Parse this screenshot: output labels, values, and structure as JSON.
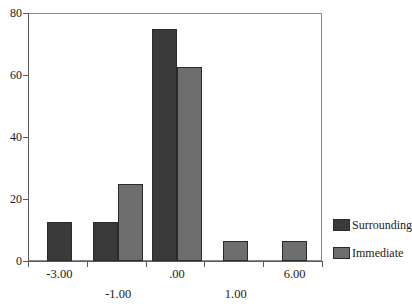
{
  "chart_data": {
    "type": "bar",
    "title": "",
    "subtitle": "",
    "xlabel": "",
    "ylabel": "",
    "grid": false,
    "legend_position": "right",
    "ylim": [
      0,
      80
    ],
    "yticks": [
      0,
      20,
      40,
      60,
      80
    ],
    "ytick_labels": [
      "0",
      "20",
      "40",
      "60",
      "80"
    ],
    "xtick_labels_upper": [
      "-3.00",
      ".00",
      "6.00"
    ],
    "xtick_labels_lower": [
      "-1.00",
      "1.00"
    ],
    "xtick_labels_all": [
      "-3.00",
      "-1.00",
      ".00",
      "1.00",
      "6.00"
    ],
    "categories": [
      "-3.00",
      "-1.00",
      ".00",
      "1.00",
      "6.00"
    ],
    "series": [
      {
        "name": "Surrounding",
        "color": "#3a3a3a",
        "values": [
          12.5,
          12.5,
          75,
          0,
          0
        ]
      },
      {
        "name": "Immediate",
        "color": "#6e6e6e",
        "values": [
          0,
          25,
          62.5,
          6.5,
          6.5
        ]
      }
    ]
  },
  "legend": {
    "items": [
      {
        "label": "Surrounding",
        "color": "#3a3a3a"
      },
      {
        "label": "Immediate",
        "color": "#6e6e6e"
      }
    ]
  },
  "axes": {
    "y": {
      "ticks": [
        {
          "label": "80",
          "value": 80
        },
        {
          "label": "60",
          "value": 60
        },
        {
          "label": "40",
          "value": 40
        },
        {
          "label": "20",
          "value": 20
        },
        {
          "label": "0",
          "value": 0
        }
      ]
    },
    "x": {
      "upper_ticks": [
        {
          "label": "-3.00"
        },
        {
          "label": ".00"
        },
        {
          "label": "6.00"
        }
      ],
      "lower_ticks": [
        {
          "label": "-1.00"
        },
        {
          "label": "1.00"
        }
      ]
    }
  }
}
